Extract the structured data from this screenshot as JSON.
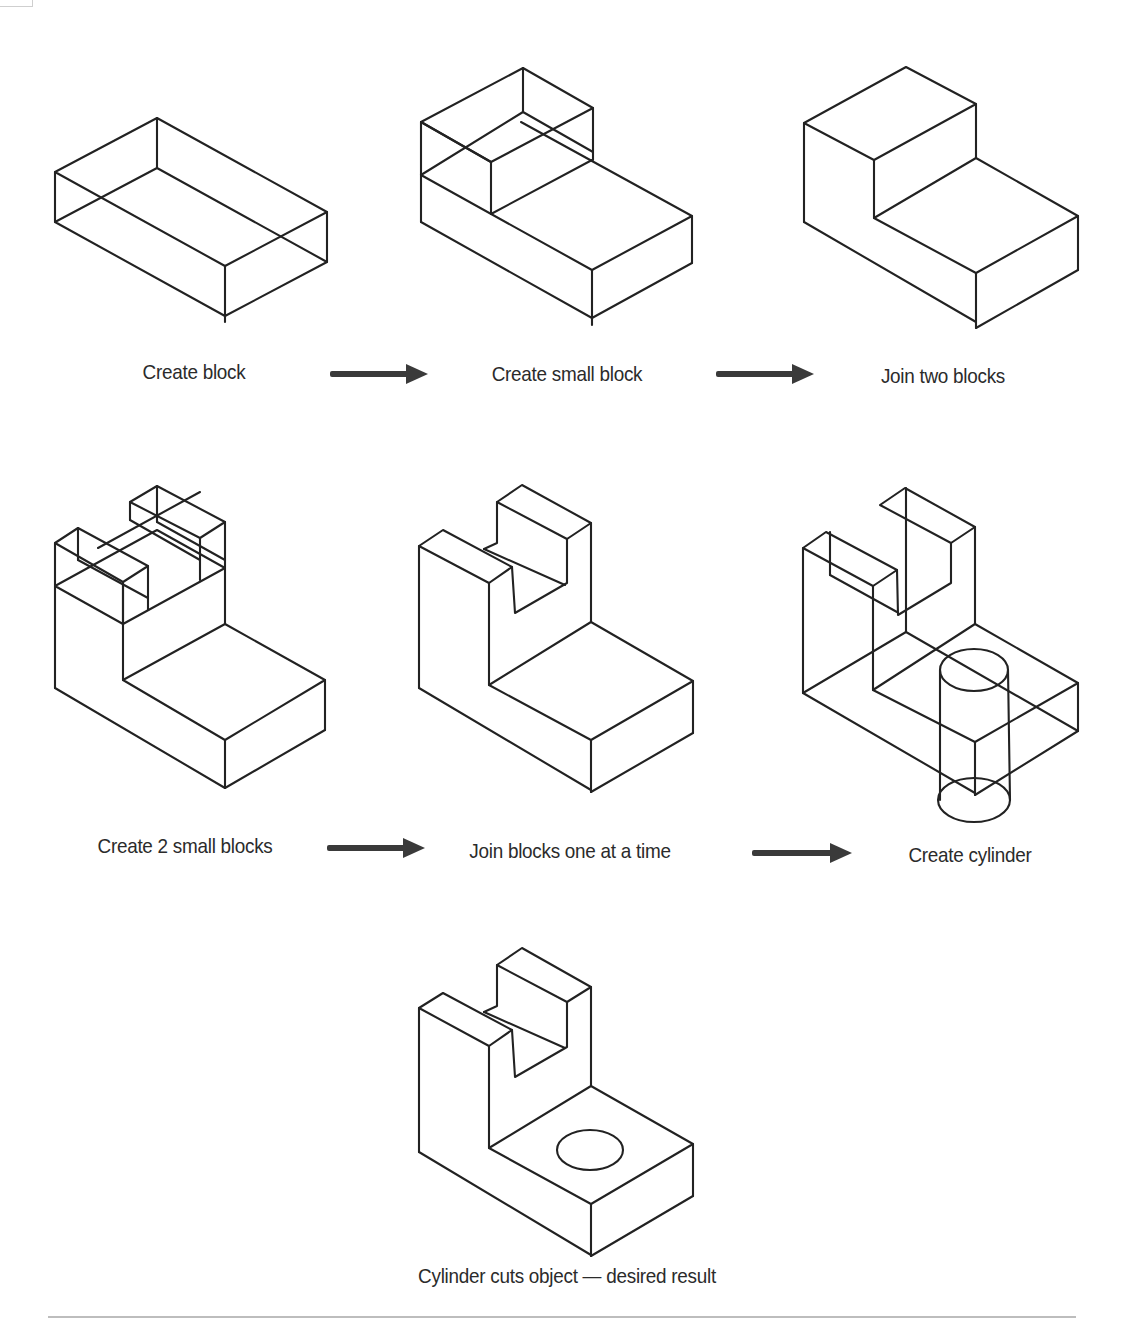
{
  "steps": [
    {
      "id": 1,
      "label": "Create block"
    },
    {
      "id": 2,
      "label": "Create small block"
    },
    {
      "id": 3,
      "label": "Join two blocks"
    },
    {
      "id": 4,
      "label": "Create 2 small blocks"
    },
    {
      "id": 5,
      "label": "Join blocks one at a time"
    },
    {
      "id": 6,
      "label": "Create cylinder"
    },
    {
      "id": 7,
      "label": "Cylinder cuts object — desired result"
    }
  ],
  "arrows": [
    {
      "from": 1,
      "to": 2,
      "icon": "right-arrow-icon"
    },
    {
      "from": 2,
      "to": 3,
      "icon": "right-arrow-icon"
    },
    {
      "from": 4,
      "to": 5,
      "icon": "right-arrow-icon"
    },
    {
      "from": 5,
      "to": 6,
      "icon": "right-arrow-icon"
    }
  ],
  "colors": {
    "line": "#222222",
    "arrow": "#3a3a3a",
    "text": "#2b2b2b",
    "rule": "#bdbdbd",
    "background": "#ffffff"
  }
}
